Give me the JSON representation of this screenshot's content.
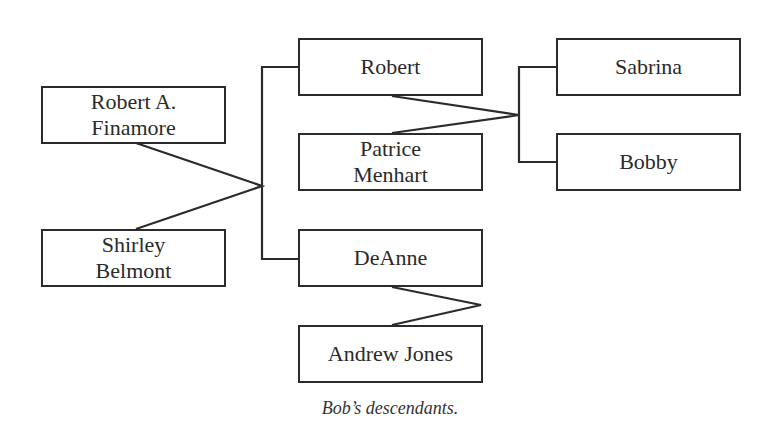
{
  "diagram": {
    "type": "family-tree",
    "caption": "Bob’s descendants.",
    "people": [
      {
        "id": "robert_a",
        "label": "Robert A.\nFinamore",
        "generation": 1
      },
      {
        "id": "shirley",
        "label": "Shirley\nBelmont",
        "generation": 1
      },
      {
        "id": "robert",
        "label": "Robert",
        "generation": 2
      },
      {
        "id": "patrice",
        "label": "Patrice\nMenhart",
        "generation": 2
      },
      {
        "id": "deanne",
        "label": "DeAnne",
        "generation": 2
      },
      {
        "id": "andrew",
        "label": "Andrew Jones",
        "generation": 2
      },
      {
        "id": "sabrina",
        "label": "Sabrina",
        "generation": 3
      },
      {
        "id": "bobby",
        "label": "Bobby",
        "generation": 3
      }
    ],
    "couples": [
      {
        "partners": [
          "robert_a",
          "shirley"
        ],
        "children": [
          "robert",
          "deanne"
        ]
      },
      {
        "partners": [
          "robert",
          "patrice"
        ],
        "children": [
          "sabrina",
          "bobby"
        ]
      },
      {
        "partners": [
          "deanne",
          "andrew"
        ],
        "children": []
      }
    ]
  },
  "labels": {
    "robert_a_1": "Robert A.",
    "robert_a_2": "Finamore",
    "shirley_1": "Shirley",
    "shirley_2": "Belmont",
    "robert": "Robert",
    "patrice_1": "Patrice",
    "patrice_2": "Menhart",
    "deanne": "DeAnne",
    "andrew": "Andrew Jones",
    "sabrina": "Sabrina",
    "bobby": "Bobby"
  }
}
